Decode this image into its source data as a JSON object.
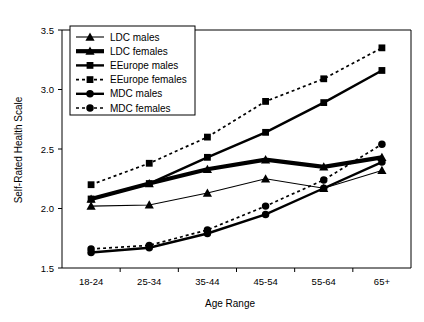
{
  "chart_data": {
    "type": "line",
    "title": "",
    "xlabel": "Age Range",
    "ylabel": "Self-Rated Health Scale",
    "categories": [
      "18-24",
      "25-34",
      "35-44",
      "45-54",
      "55-64",
      "65+"
    ],
    "ylim": [
      1.5,
      3.5
    ],
    "yticks": [
      "1.5",
      "2.0",
      "2.5",
      "3.0",
      "3.5"
    ],
    "ytick_values": [
      1.5,
      2.0,
      2.5,
      3.0,
      3.5
    ],
    "grid": false,
    "legend_position": "top-left inside plot",
    "series": [
      {
        "name": "LDC males",
        "marker": "triangle",
        "line_style": "solid",
        "line_weight": "thin",
        "color": "#000000",
        "values": [
          2.02,
          2.03,
          2.13,
          2.25,
          2.17,
          2.32
        ]
      },
      {
        "name": "LDC females",
        "marker": "triangle",
        "line_style": "solid",
        "line_weight": "thick-gray",
        "color": "#8c8c8c",
        "values": [
          2.08,
          2.21,
          2.33,
          2.41,
          2.35,
          2.43
        ]
      },
      {
        "name": "EEurope males",
        "marker": "square",
        "line_style": "solid",
        "line_weight": "heavy",
        "color": "#000000",
        "values": [
          2.08,
          2.21,
          2.43,
          2.64,
          2.89,
          3.16
        ]
      },
      {
        "name": "EEurope females",
        "marker": "square",
        "line_style": "dotted",
        "line_weight": "medium",
        "color": "#000000",
        "values": [
          2.2,
          2.38,
          2.6,
          2.9,
          3.09,
          3.35
        ]
      },
      {
        "name": "MDC males",
        "marker": "circle",
        "line_style": "solid",
        "line_weight": "heavy",
        "color": "#000000",
        "values": [
          1.63,
          1.67,
          1.79,
          1.95,
          2.17,
          2.39
        ]
      },
      {
        "name": "MDC females",
        "marker": "circle",
        "line_style": "dotted",
        "line_weight": "medium",
        "color": "#000000",
        "values": [
          1.66,
          1.69,
          1.82,
          2.02,
          2.24,
          2.54
        ]
      }
    ]
  }
}
